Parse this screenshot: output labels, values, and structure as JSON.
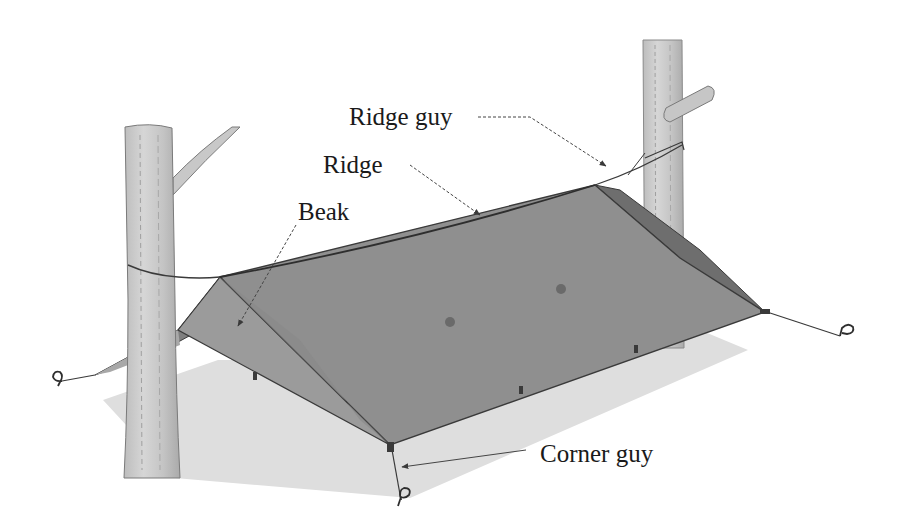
{
  "diagram": {
    "labels": {
      "ridge_guy": "Ridge guy",
      "ridge": "Ridge",
      "beak": "Beak",
      "corner_guy": "Corner guy"
    },
    "colors": {
      "tarp": "#8f8f8f",
      "tarp_dark": "#6e6e6e",
      "beak": "#9a9a9a",
      "shadow": "#dcdcdc",
      "tree": "#cfcfcf",
      "tree_edge": "#7a7a7a",
      "line": "#3a3a3a",
      "text": "#1a1a1a"
    }
  }
}
